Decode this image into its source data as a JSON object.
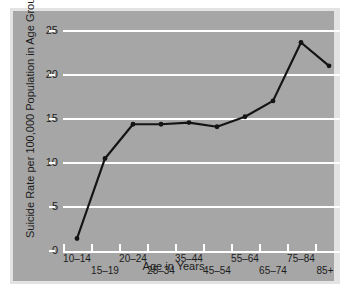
{
  "chart_data": {
    "type": "line",
    "title": "",
    "xlabel": "Age in Years",
    "ylabel": "Suicide Rate per 100,000 Population in Age Group",
    "categories": [
      "10–14",
      "15–19",
      "20–24",
      "25–34",
      "35–44",
      "45–54",
      "55–64",
      "65–74",
      "75–84",
      "85+"
    ],
    "values": [
      1.5,
      11.1,
      15.2,
      15.2,
      15.4,
      14.9,
      16.1,
      18.0,
      25.0,
      22.2
    ],
    "series": [
      {
        "name": "Suicide rate",
        "values": [
          1.5,
          11.1,
          15.2,
          15.2,
          15.4,
          14.9,
          16.1,
          18.0,
          25.0,
          22.2
        ]
      }
    ],
    "ylim": [
      0,
      26.5
    ],
    "yticks": [
      0,
      5,
      10,
      15,
      20,
      25
    ],
    "ytick_labels": [
      "0",
      "5",
      "10",
      "15",
      "20",
      "25"
    ],
    "grid": true,
    "grid_color": "#ffffff",
    "legend": "none",
    "line_color": "#141414",
    "marker": "circle",
    "marker_color": "#141414",
    "panel_color": "#a6a6a6",
    "background_color": "#ffffff",
    "text_color": "#1c1c1c"
  },
  "axes": {
    "x_title": "Age in Years",
    "y_title": "Suicide Rate per 100,000 Population in Age Group",
    "y_tick_labels": [
      "25",
      "20",
      "15",
      "10",
      "5",
      "0"
    ],
    "x_tick_labels_top": [
      "10–14",
      "20–24",
      "35–44",
      "55–64",
      "75–84"
    ],
    "x_tick_labels_bottom": [
      "15–19",
      "25–34",
      "45–54",
      "65–74",
      "85+"
    ]
  }
}
